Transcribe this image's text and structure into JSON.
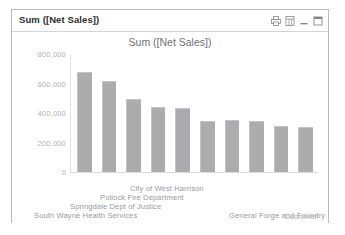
{
  "window": {
    "caption_title": "Sum ([Net Sales])",
    "buttons": [
      {
        "name": "print-icon",
        "label": "Print"
      },
      {
        "name": "export-to-excel-icon",
        "label": "Send to Excel"
      },
      {
        "name": "minimize-icon",
        "label": "Minimize"
      },
      {
        "name": "maximize-icon",
        "label": "Maximize"
      }
    ]
  },
  "chart_data": {
    "type": "bar",
    "title": "Sum ([Net Sales])",
    "xlabel": "Customer",
    "ylabel": "",
    "ylim": [
      0,
      800000
    ],
    "yticks": [
      "0",
      "200,000",
      "400,000",
      "600,000",
      "800,000"
    ],
    "ytick_values": [
      0,
      200000,
      400000,
      600000,
      800000
    ],
    "grid": false,
    "legend": "none",
    "bar_color": "#acacae",
    "categories": [
      "City of West Harrison",
      "Pollock Fire Department",
      "Springdale Dept of Justice",
      "South Wayne Health Services",
      "General Forge and Foundry",
      "",
      "",
      "",
      "",
      ""
    ],
    "values": [
      680000,
      620000,
      492000,
      444000,
      432000,
      348000,
      352000,
      344000,
      312000,
      308000
    ],
    "visible_category_labels": [
      {
        "text": "City of West Harrison",
        "left": 118,
        "top": 0
      },
      {
        "text": "Pollock Fire Department",
        "left": 88,
        "top": 9
      },
      {
        "text": "Springdale Dept of Justice",
        "left": 58,
        "top": 18
      },
      {
        "text": "South Wayne Health Services",
        "left": 22,
        "top": 27
      },
      {
        "text": "General Forge and Foundry",
        "left": 217,
        "top": 27
      }
    ],
    "axis_title_position": {
      "left": 272,
      "top": 28
    }
  }
}
